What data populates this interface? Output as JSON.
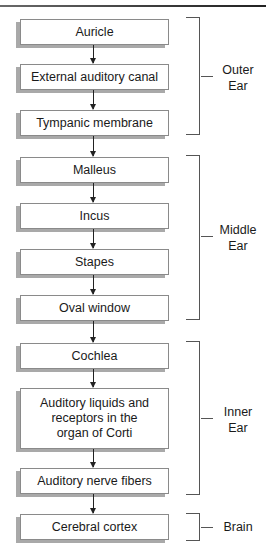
{
  "diagram": {
    "type": "flowchart",
    "direction": "top-to-bottom",
    "steps": [
      {
        "label": "Auricle"
      },
      {
        "label": "External auditory canal"
      },
      {
        "label": "Tympanic membrane"
      },
      {
        "label": "Malleus"
      },
      {
        "label": "Incus"
      },
      {
        "label": "Stapes"
      },
      {
        "label": "Oval window"
      },
      {
        "label": "Cochlea"
      },
      {
        "label": "Auditory liquids and receptors in the organ of Corti"
      },
      {
        "label": "Auditory nerve fibers"
      },
      {
        "label": "Cerebral cortex"
      }
    ],
    "groups": [
      {
        "label": "Outer Ear",
        "line1": "Outer",
        "line2": "Ear",
        "steps": [
          0,
          1,
          2
        ]
      },
      {
        "label": "Middle Ear",
        "line1": "Middle",
        "line2": "Ear",
        "steps": [
          3,
          4,
          5,
          6
        ]
      },
      {
        "label": "Inner Ear",
        "line1": "Inner",
        "line2": "Ear",
        "steps": [
          7,
          8,
          9
        ]
      },
      {
        "label": "Brain",
        "line1": "Brain",
        "line2": "",
        "steps": [
          10
        ]
      }
    ],
    "multiline": {
      "step8_line1": "Auditory liquids and",
      "step8_line2": "receptors in the",
      "step8_line3": "organ of Corti"
    }
  }
}
